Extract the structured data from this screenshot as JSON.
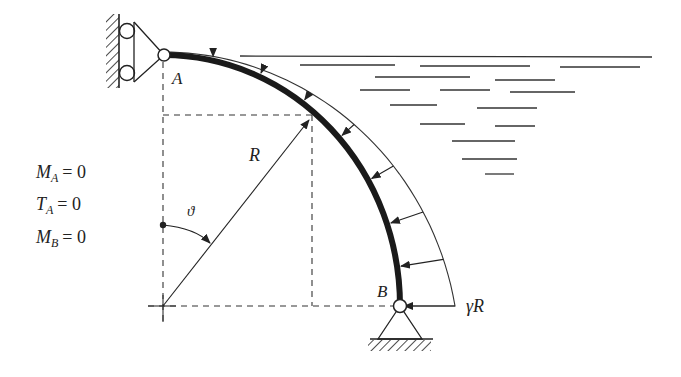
{
  "diagram": {
    "type": "curved beam under hydrostatic pressure",
    "labels": {
      "point_a": "A",
      "point_b": "B",
      "radius": "R",
      "angle": "ϑ",
      "load_max": "γR"
    },
    "conditions": [
      {
        "symbol": "M",
        "sub": "A",
        "rhs": "= 0"
      },
      {
        "symbol": "T",
        "sub": "A",
        "rhs": "= 0"
      },
      {
        "symbol": "M",
        "sub": "B",
        "rhs": "= 0"
      }
    ],
    "supports": {
      "a": "roller against vertical wall",
      "b": "pinned on ground"
    },
    "colors": {
      "ink": "#222222",
      "background": "#ffffff"
    },
    "geometry": {
      "center": [
        163,
        306
      ],
      "rx": 237,
      "ry": 251,
      "load_scale_px": 52,
      "arrow_angles_deg": [
        12,
        24,
        36,
        48,
        60,
        71,
        81,
        90
      ]
    }
  }
}
